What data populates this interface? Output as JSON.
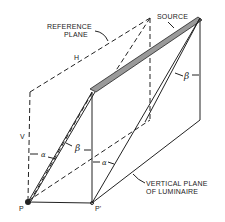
{
  "diagram": {
    "labels": {
      "source": "SOURCE",
      "reference_plane_line1": "REFERENCE",
      "reference_plane_line2": "PLANE",
      "h": "H",
      "v": "V",
      "alpha": "α",
      "beta": "β",
      "p": "P",
      "p_prime": "P'",
      "vertical_plane_line1": "VERTICAL PLANE",
      "vertical_plane_line2": "OF LUMINAIRE"
    },
    "colors": {
      "ink": "#222222",
      "source_fill": "#9a9a9a",
      "background": "#ffffff"
    }
  }
}
